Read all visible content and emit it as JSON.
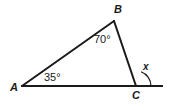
{
  "diagram": {
    "vertices": [
      {
        "name": "A",
        "label": "A",
        "x": 22,
        "y": 86
      },
      {
        "name": "B",
        "label": "B",
        "x": 114,
        "y": 21
      },
      {
        "name": "C",
        "label": "C",
        "x": 136,
        "y": 86
      }
    ],
    "angle_labels": [
      {
        "name": "angle-at-A",
        "label": "35°",
        "vertex": "A"
      },
      {
        "name": "angle-at-B",
        "label": "70°",
        "vertex": "B"
      },
      {
        "name": "exterior-angle-at-C",
        "label": "x",
        "vertex": "C"
      }
    ],
    "segments": [
      {
        "name": "side-AB",
        "from": "A",
        "to": "B"
      },
      {
        "name": "side-BC",
        "from": "B",
        "to": "C"
      },
      {
        "name": "base-line-A-to-extension",
        "from": [
          21,
          86
        ],
        "to": [
          163,
          86
        ]
      }
    ],
    "extension_end_x": 163,
    "arc": {
      "name": "exterior-angle-arc",
      "center": [
        136,
        86
      ],
      "radius": 15
    },
    "colors": {
      "background": "#ffffff",
      "stroke": "#1a1a1a",
      "text": "#1a1a1a"
    },
    "stroke_width": 2
  }
}
